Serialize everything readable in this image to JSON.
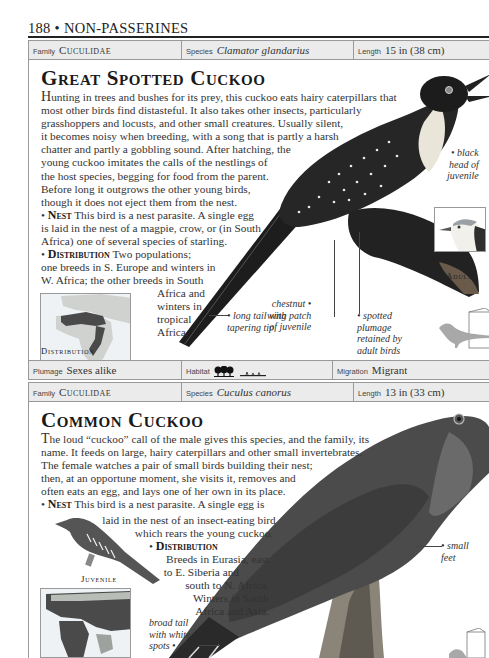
{
  "page": {
    "number": "188",
    "separator": "•",
    "section": "NON-PASSERINES",
    "header_text": "188 • NON-PASSERINES"
  },
  "entries": [
    {
      "info_top": {
        "family_label": "Family",
        "family_value": "Cuculidae",
        "species_label": "Species",
        "species_value": "Clamator glandarius",
        "length_label": "Length",
        "length_value": "15 in (38 cm)"
      },
      "title": "Great Spotted Cuckoo",
      "description": "Hunting in trees and bushes for its prey, this cuckoo eats hairy caterpillars that most other birds find distasteful. It also takes other insects, particularly grasshoppers and locusts, and other small creatures. Usually silent, it becomes noisy when breeding, with a song that is partly a harsh chatter and partly a gobbling sound. After hatching, the young cuckoo imitates the calls of the nestlings of the host species, begging for food from the parent. Before long it outgrows the other young birds, though it does not eject them from the nest.",
      "description_lines": [
        "Hunting in trees and bushes for its prey, this cuckoo eats hairy caterpillars that",
        "most other birds find distasteful. It also takes other insects, particularly",
        "grasshoppers and locusts, and other small creatures. Usually silent,",
        "it becomes noisy when breeding, with a song that is partly a harsh",
        "chatter and partly a gobbling sound. After hatching, the",
        "young cuckoo imitates the calls of the nestlings of",
        "the host species, begging for food from the parent.",
        "Before long it outgrows the other young birds,",
        "though it does not eject them from the nest."
      ],
      "nest_heading": "Nest",
      "nest_lines": [
        "This bird is a nest parasite. A single egg",
        "is laid in the nest of a magpie, crow, or (in South",
        "Africa) one of several species of starling."
      ],
      "distribution_heading": "Distribution",
      "distribution_lines": [
        "Two populations;",
        "one breeds in S. Europe and winters in",
        "W. Africa; the other breeds in South",
        "Africa and",
        "winters in",
        "tropical",
        "Africa."
      ],
      "map_label": "Distribution",
      "inset_label": "Adult",
      "annotations": {
        "black_head": [
          "black",
          "head of",
          "juvenile"
        ],
        "chestnut_wing": [
          "chestnut",
          "wing patch",
          "of juvenile"
        ],
        "spotted_plumage": [
          "spotted",
          "plumage",
          "retained by",
          "adult birds"
        ],
        "long_tail": [
          "long tail with",
          "tapering tip"
        ]
      },
      "info_bottom": {
        "plumage_label": "Plumage",
        "plumage_value": "Sexes alike",
        "habitat_label": "Habitat",
        "habitat_icons": [
          "trees-icon",
          "grassland-icon"
        ],
        "migration_label": "Migration",
        "migration_value": "Migrant"
      }
    },
    {
      "info_top": {
        "family_label": "Family",
        "family_value": "Cuculidae",
        "species_label": "Species",
        "species_value": "Cuculus canorus",
        "length_label": "Length",
        "length_value": "13 in (33 cm)"
      },
      "title": "Common Cuckoo",
      "description_lines": [
        "The loud “cuckoo” call of the male gives this species, and the family, its",
        "name. It feeds on large, hairy caterpillars and other small invertebrates.",
        "The female watches a pair of small birds building their nest;",
        "then, at an opportune moment, she visits it, removes and",
        "often eats an egg, and lays one of her own in its place."
      ],
      "nest_heading": "Nest",
      "nest_lines": [
        "This bird is a nest parasite. A single egg is",
        "laid in the nest of an insect-eating bird",
        "which rears the young cuckoo."
      ],
      "distribution_heading": "Distribution",
      "distribution_lines": [
        "Breeds in Eurasia, east",
        "to E. Siberia and",
        "south to N. Africa.",
        "Winters in South",
        "Africa and Asia."
      ],
      "inset_label": "Juvenile",
      "annotations": {
        "small_feet": [
          "small",
          "feet"
        ],
        "broad_tail": [
          "broad tail",
          "with white",
          "spots"
        ]
      }
    }
  ],
  "colors": {
    "info_bar_bg": "#ebebeb",
    "rule": "#222222",
    "text": "#333333",
    "map_land": "#c9ccc9",
    "map_range": "#4a4a4a",
    "silhouette": "#a8a8a8"
  }
}
